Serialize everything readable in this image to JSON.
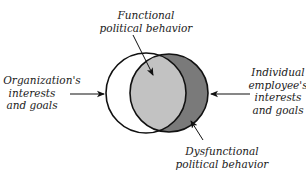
{
  "diagram": {
    "type": "venn",
    "colors": {
      "background": "#ffffff",
      "left_circle_fill": "#ffffff",
      "overlap_fill": "#c2c2c2",
      "right_only_fill": "#7a7a7a",
      "stroke": "#111111"
    },
    "circles": [
      {
        "id": "organization",
        "cx": 146,
        "cy": 93,
        "r": 40
      },
      {
        "id": "individual",
        "cx": 169,
        "cy": 93,
        "r": 39
      }
    ],
    "labels": {
      "functional": {
        "line1": "Functional",
        "line2": "political behavior"
      },
      "dysfunctional": {
        "line1": "Dysfunctional",
        "line2": "political behavior"
      },
      "organization": {
        "line1": "Organization's",
        "line2": "interests",
        "line3": "and goals"
      },
      "individual": {
        "line1": "Individual",
        "line2": "employee's",
        "line3": "interests",
        "line4": "and goals"
      }
    }
  }
}
